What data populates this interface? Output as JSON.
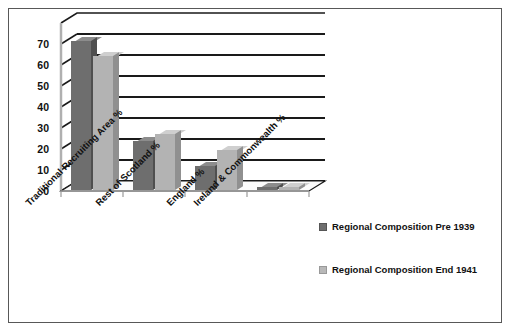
{
  "chart_data": {
    "type": "bar",
    "title": "",
    "xlabel": "",
    "ylabel": "",
    "ylim": [
      0,
      75
    ],
    "yticks": [
      70,
      60,
      50,
      40,
      30,
      20,
      10,
      0
    ],
    "grid": true,
    "legend_position": "right",
    "three_d": true,
    "categories": [
      "Traditional Recruiting Area %",
      "Rest of Scotland %",
      "England %",
      "Ireland & Commonwealth %"
    ],
    "series": [
      {
        "name": "Regional Composition Pre 1939",
        "color": "#6e6e6e",
        "values": [
          67,
          22,
          11,
          0
        ]
      },
      {
        "name": "Regional Composition End 1941",
        "color": "#b3b3b3",
        "values": [
          60,
          25,
          18,
          0
        ]
      }
    ]
  },
  "legend": {
    "items": [
      {
        "label": "Regional Composition Pre 1939",
        "swatch": "dark"
      },
      {
        "label": "Regional Composition End 1941",
        "swatch": "light"
      }
    ]
  },
  "axis": {
    "y_tick_labels": [
      "70",
      "60",
      "50",
      "40",
      "30",
      "20",
      "10",
      "0"
    ],
    "x_tick_labels": [
      "Traditional Recruiting Area %",
      "Rest of Scotland %",
      "England %",
      "Ireland & Commonwealth %"
    ]
  }
}
